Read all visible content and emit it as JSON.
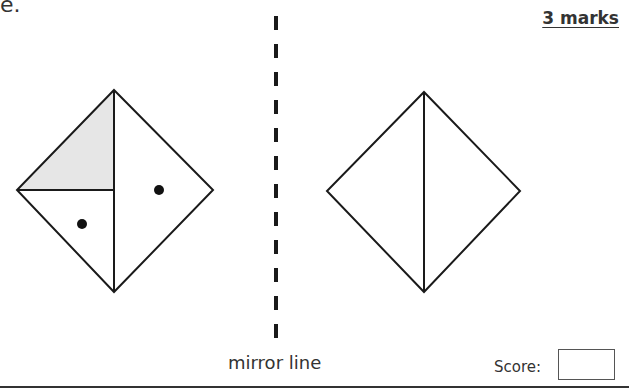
{
  "header": {
    "stray_text": "e.",
    "marks": "3 marks"
  },
  "figure": {
    "mirror_line_label": "mirror line",
    "left_shape": {
      "description": "square rotated 45°, split by a vertical line and a half-horizontal line; top-left triangle shaded grey, one dot in each of two white regions",
      "shaded_color": "#e6e6e6",
      "dots": 2
    },
    "right_shape": {
      "description": "square rotated 45°, split by a vertical line; to be completed as reflection"
    }
  },
  "footer": {
    "score_label": "Score:",
    "score_value": ""
  }
}
